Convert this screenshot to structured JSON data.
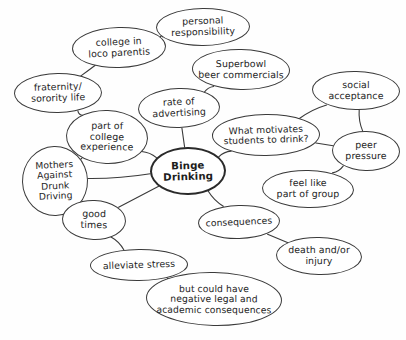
{
  "diagram": {
    "background_color": "#fefefe",
    "ink_color": "#3a3a3a",
    "central_node_color": "#2a2a2a"
  },
  "nodes": [
    {
      "id": "personal_responsibility",
      "label": "personal\nresponsibility",
      "x": 156,
      "y": 8,
      "w": 94,
      "h": 38,
      "font_size": 9.4,
      "tilt": "tilt-c",
      "central": false
    },
    {
      "id": "college_loco_parentis",
      "label": "college in\nloco parentis",
      "x": 72,
      "y": 27,
      "w": 94,
      "h": 41,
      "font_size": 9.4,
      "tilt": "tilt-a",
      "central": false
    },
    {
      "id": "superbowl_commercials",
      "label": "Superbowl\nbeer commercials",
      "x": 192,
      "y": 49,
      "w": 98,
      "h": 41,
      "font_size": 9.4,
      "tilt": "tilt-b",
      "central": false
    },
    {
      "id": "fraternity_sorority",
      "label": "fraternity/\nsorority life",
      "x": 14,
      "y": 73,
      "w": 88,
      "h": 40,
      "font_size": 9.4,
      "tilt": "tilt-c",
      "central": false
    },
    {
      "id": "social_acceptance",
      "label": "social\nacceptance",
      "x": 312,
      "y": 71,
      "w": 88,
      "h": 39,
      "font_size": 9.4,
      "tilt": "tilt-b",
      "central": false
    },
    {
      "id": "rate_of_advertising",
      "label": "rate of\nadvertising",
      "x": 138,
      "y": 88,
      "w": 82,
      "h": 40,
      "font_size": 9.4,
      "tilt": "tilt-a",
      "central": false
    },
    {
      "id": "part_of_college",
      "label": "part of\ncollege\nexperience",
      "x": 66,
      "y": 110,
      "w": 82,
      "h": 54,
      "font_size": 9.4,
      "tilt": "tilt-d",
      "central": false
    },
    {
      "id": "what_motivates",
      "label": "What motivates\nstudents to drink?",
      "x": 212,
      "y": 114,
      "w": 108,
      "h": 42,
      "font_size": 9.2,
      "tilt": "tilt-c",
      "central": false
    },
    {
      "id": "peer_pressure",
      "label": "peer\npressure",
      "x": 332,
      "y": 131,
      "w": 68,
      "h": 40,
      "font_size": 9.4,
      "tilt": "tilt-b",
      "central": false
    },
    {
      "id": "mothers_against",
      "label": "Mothers\nAgainst\nDrunk\nDriving",
      "x": 22,
      "y": 146,
      "w": 66,
      "h": 70,
      "font_size": 9.2,
      "tilt": "tilt-a",
      "central": false
    },
    {
      "id": "binge_drinking",
      "label": "Binge\nDrinking",
      "x": 150,
      "y": 147,
      "w": 76,
      "h": 48,
      "font_size": 10.2,
      "tilt": "tilt-c",
      "central": true
    },
    {
      "id": "feel_like_part_of_group",
      "label": "feel like\npart of group",
      "x": 262,
      "y": 170,
      "w": 92,
      "h": 38,
      "font_size": 9.4,
      "tilt": "tilt-b",
      "central": false
    },
    {
      "id": "good_times",
      "label": "good\ntimes",
      "x": 62,
      "y": 200,
      "w": 64,
      "h": 40,
      "font_size": 9.4,
      "tilt": "tilt-d",
      "central": false
    },
    {
      "id": "consequences",
      "label": "consequences",
      "x": 198,
      "y": 205,
      "w": 82,
      "h": 34,
      "font_size": 9.2,
      "tilt": "tilt-a",
      "central": false
    },
    {
      "id": "death_or_injury",
      "label": "death and/or\ninjury",
      "x": 276,
      "y": 237,
      "w": 86,
      "h": 38,
      "font_size": 9.4,
      "tilt": "tilt-b",
      "central": false
    },
    {
      "id": "alleviate_stress",
      "label": "alleviate stress",
      "x": 90,
      "y": 249,
      "w": 98,
      "h": 32,
      "font_size": 9.4,
      "tilt": "tilt-c",
      "central": false
    },
    {
      "id": "negative_consequences",
      "label": "but could have\nnegative legal and\nacademic consequences",
      "x": 146,
      "y": 272,
      "w": 136,
      "h": 54,
      "font_size": 9.2,
      "tilt": "tilt-b",
      "central": false
    }
  ],
  "edges": [
    {
      "from": "college_loco_parentis",
      "to": "personal_responsibility"
    },
    {
      "from": "college_loco_parentis",
      "to": "fraternity_sorority"
    },
    {
      "from": "fraternity_sorority",
      "to": "part_of_college"
    },
    {
      "from": "part_of_college",
      "to": "binge_drinking"
    },
    {
      "from": "part_of_college",
      "to": "mothers_against"
    },
    {
      "from": "mothers_against",
      "to": "binge_drinking"
    },
    {
      "from": "rate_of_advertising",
      "to": "superbowl_commercials"
    },
    {
      "from": "rate_of_advertising",
      "to": "binge_drinking"
    },
    {
      "from": "what_motivates",
      "to": "binge_drinking"
    },
    {
      "from": "what_motivates",
      "to": "social_acceptance"
    },
    {
      "from": "what_motivates",
      "to": "peer_pressure"
    },
    {
      "from": "social_acceptance",
      "to": "peer_pressure"
    },
    {
      "from": "peer_pressure",
      "to": "feel_like_part_of_group"
    },
    {
      "from": "binge_drinking",
      "to": "good_times"
    },
    {
      "from": "binge_drinking",
      "to": "consequences"
    },
    {
      "from": "good_times",
      "to": "alleviate_stress"
    },
    {
      "from": "consequences",
      "to": "death_or_injury"
    },
    {
      "from": "alleviate_stress",
      "to": "negative_consequences"
    }
  ]
}
